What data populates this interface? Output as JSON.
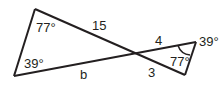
{
  "diagram": {
    "type": "two triangles sharing a vertex (bowtie)",
    "stroke_color": "#231f20",
    "left_triangle": {
      "angles": {
        "top": "77°",
        "bottom": "39°"
      },
      "sides": {
        "top_segment": "15",
        "bottom_segment": "b"
      }
    },
    "right_triangle": {
      "angles": {
        "right_top": "39°",
        "right_bottom": "77°"
      },
      "sides": {
        "top_segment": "4",
        "bottom_segment": "3"
      }
    }
  }
}
